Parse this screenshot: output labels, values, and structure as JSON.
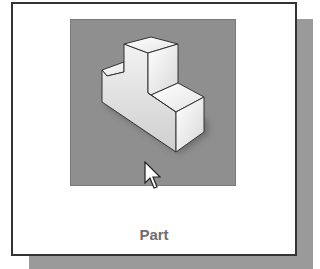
{
  "tile": {
    "label": "Part",
    "icon": "part-3d-icon",
    "background_color": "#8f8f8f",
    "selected": true
  },
  "cursor": {
    "icon": "arrow-cursor-icon"
  }
}
